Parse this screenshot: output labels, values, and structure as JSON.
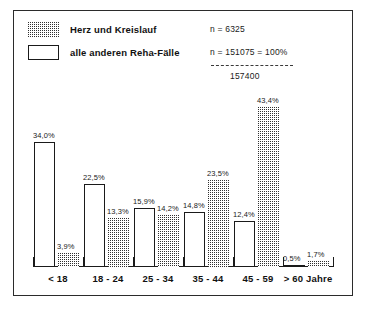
{
  "legend": {
    "items": [
      {
        "label": "Herz und Kreislauf",
        "swatch": "dotted-pattern",
        "n_text": "n =    6325"
      },
      {
        "label": "alle anderen Reha-Fälle",
        "swatch": "open-white",
        "n_text": "n = 151075 = 100%"
      }
    ],
    "total_text": "157400"
  },
  "chart_data": {
    "type": "bar",
    "title": "",
    "xlabel": "",
    "ylabel": "",
    "grid": false,
    "legend_position": "top-left",
    "ylim": [
      0,
      45
    ],
    "categories": [
      "< 18",
      "18 - 24",
      "25 - 34",
      "35 - 44",
      "45 - 59",
      "> 60 Jahre"
    ],
    "series": [
      {
        "name": "alle anderen Reha-Fälle",
        "fill": "open-white",
        "values": [
          34.0,
          22.5,
          15.9,
          14.8,
          12.4,
          0.5
        ],
        "labels": [
          "34,0%",
          "22,5%",
          "15,9%",
          "14,8%",
          "12,4%",
          "0,5%"
        ]
      },
      {
        "name": "Herz und Kreislauf",
        "fill": "dotted-pattern",
        "values": [
          3.9,
          13.3,
          14.2,
          23.5,
          43.4,
          1.7
        ],
        "labels": [
          "3,9%",
          "13,3%",
          "14,2%",
          "23,5%",
          "43,4%",
          "1,7%"
        ]
      }
    ],
    "annotations": {
      "n_heart": "n =    6325",
      "n_other": "n = 151075 = 100%",
      "n_total": "157400"
    }
  },
  "colors": {
    "ink": "#1a1a1a",
    "frame": "#2b2b2b",
    "background": "#ffffff",
    "pattern_dot": "#303030"
  }
}
